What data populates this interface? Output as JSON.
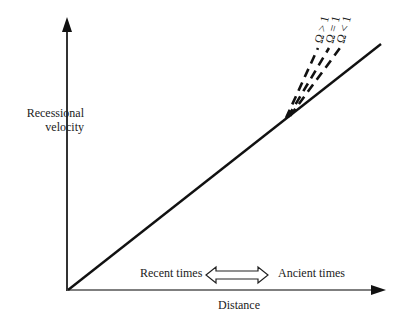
{
  "diagram": {
    "y_axis_label_line1": "Recessional",
    "y_axis_label_line2": "velocity",
    "x_axis_label": "Distance",
    "time_left_label": "Recent times",
    "time_right_label": "Ancient times",
    "curves": [
      {
        "label": "Ω > 1",
        "style": "dashed"
      },
      {
        "label": "Ω = 1",
        "style": "dashed"
      },
      {
        "label": "Ω < 1",
        "style": "dashed"
      },
      {
        "label": "Hubble law (linear)",
        "style": "solid"
      }
    ],
    "colors": {
      "line": "#111111",
      "background": "#ffffff"
    }
  },
  "omega": {
    "gt": "Ω > 1",
    "eq": "Ω = 1",
    "lt": "Ω < 1"
  }
}
